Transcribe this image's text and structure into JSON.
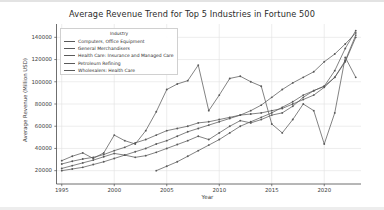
{
  "chart_data": {
    "type": "line",
    "title": "Average Revenue Trend for Top 5 Industries in Fortune 500",
    "xlabel": "Year",
    "ylabel": "Average Revenue (Million USD)",
    "legend_title": "Industry",
    "legend_position": "upper left",
    "grid": true,
    "xlim": [
      1994.5,
      2023.5
    ],
    "ylim": [
      8000,
      152000
    ],
    "xticks": [
      "1995",
      "2000",
      "2005",
      "2010",
      "2015",
      "2020"
    ],
    "xtick_values": [
      1995,
      2000,
      2005,
      2010,
      2015,
      2020
    ],
    "yticks": [
      "20000",
      "40000",
      "60000",
      "80000",
      "100000",
      "120000",
      "140000"
    ],
    "ytick_values": [
      20000,
      40000,
      60000,
      80000,
      100000,
      120000,
      140000
    ],
    "marker": "circle",
    "line_color": "#5a5a5a",
    "series": [
      {
        "name": "Computers, Office Equipment",
        "color": "#5a5a5a",
        "x": [
          1995,
          1996,
          1997,
          1998,
          1999,
          2000,
          2001,
          2002,
          2003,
          2004,
          2005,
          2006,
          2007,
          2008,
          2009,
          2010,
          2011,
          2012,
          2013,
          2014,
          2015,
          2016,
          2017,
          2018,
          2019,
          2020,
          2021,
          2022,
          2023
        ],
        "y": [
          22000,
          24500,
          27000,
          29500,
          32500,
          35500,
          34000,
          32000,
          33500,
          36500,
          40000,
          43500,
          47000,
          51000,
          48000,
          54000,
          60000,
          65000,
          63000,
          66000,
          70000,
          72000,
          78000,
          86000,
          92000,
          96000,
          110000,
          130000,
          146000
        ]
      },
      {
        "name": "General Merchandisers",
        "color": "#5a5a5a",
        "x": [
          1995,
          1996,
          1997,
          1998,
          1999,
          2000,
          2001,
          2002,
          2003,
          2004,
          2005,
          2006,
          2007,
          2008,
          2009,
          2010,
          2011,
          2012,
          2013,
          2014,
          2015,
          2016,
          2017,
          2018,
          2019,
          2020,
          2021,
          2022,
          2023
        ],
        "y": [
          26000,
          28500,
          30500,
          32000,
          34500,
          38000,
          41000,
          45000,
          48000,
          52000,
          56000,
          58000,
          60000,
          63000,
          64000,
          66000,
          68000,
          70000,
          71000,
          72000,
          74000,
          76000,
          80000,
          84000,
          88000,
          95000,
          104000,
          118000,
          140000
        ]
      },
      {
        "name": "Health Care: Insurance and Managed Care",
        "color": "#5a5a5a",
        "x": [
          1995,
          1996,
          1997,
          1998,
          1999,
          2000,
          2001,
          2002,
          2003,
          2004,
          2005,
          2006,
          2007,
          2008,
          2009,
          2010,
          2011,
          2012,
          2013,
          2014,
          2015,
          2016,
          2017,
          2018,
          2019,
          2020,
          2021,
          2022,
          2023
        ],
        "y": [
          20000,
          21500,
          23000,
          25500,
          28000,
          31000,
          34000,
          37000,
          40000,
          44000,
          47000,
          51000,
          55000,
          58000,
          61000,
          64000,
          67000,
          70000,
          74000,
          79000,
          86000,
          93000,
          99000,
          104000,
          109000,
          118000,
          125000,
          134000,
          144000
        ]
      },
      {
        "name": "Petroleum Refining",
        "color": "#5a5a5a",
        "x": [
          1995,
          1996,
          1997,
          1998,
          1999,
          2000,
          2001,
          2002,
          2003,
          2004,
          2005,
          2006,
          2007,
          2008,
          2009,
          2010,
          2011,
          2012,
          2013,
          2014,
          2015,
          2016,
          2017,
          2018,
          2019,
          2020,
          2021,
          2022,
          2023
        ],
        "y": [
          29000,
          33000,
          36000,
          31000,
          36000,
          52000,
          47000,
          44000,
          56000,
          73000,
          93000,
          98000,
          101000,
          115000,
          74000,
          88000,
          103000,
          105000,
          100000,
          96000,
          62000,
          54000,
          66000,
          80000,
          74000,
          44000,
          72000,
          122000,
          104000
        ]
      },
      {
        "name": "Wholesalers: Health Care",
        "color": "#5a5a5a",
        "x": [
          2004,
          2005,
          2006,
          2007,
          2008,
          2009,
          2010,
          2011,
          2012,
          2013,
          2014,
          2015,
          2016,
          2017,
          2018,
          2019,
          2020,
          2021,
          2022,
          2023
        ],
        "y": [
          20000,
          24000,
          28000,
          33000,
          38000,
          43000,
          48000,
          54000,
          60000,
          64000,
          68000,
          72000,
          77000,
          82000,
          88000,
          92000,
          96000,
          104000,
          119000,
          142000
        ]
      }
    ]
  }
}
